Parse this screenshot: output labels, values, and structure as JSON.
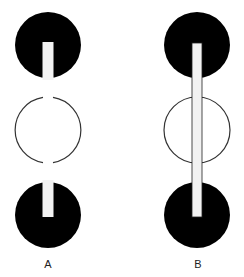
{
  "diagram": {
    "panels": [
      {
        "label": "A",
        "description": "Two black discs with short slots, open ring between them; no connecting rod",
        "cx": 48,
        "top_disc": {
          "cy": 45,
          "r": 33
        },
        "ring": {
          "cy": 130,
          "r": 33
        },
        "bottom_disc": {
          "cy": 215,
          "r": 33
        }
      },
      {
        "label": "B",
        "description": "Two black discs connected by a long rod passing through the ring",
        "cx": 197,
        "top_disc": {
          "cy": 45,
          "r": 33
        },
        "ring": {
          "cy": 130,
          "r": 33
        },
        "bottom_disc": {
          "cy": 215,
          "r": 33
        }
      }
    ],
    "colors": {
      "disc": "#000000",
      "ring_stroke": "#333333",
      "slot_fill": "#f2f2f2",
      "background": "#ffffff"
    }
  }
}
